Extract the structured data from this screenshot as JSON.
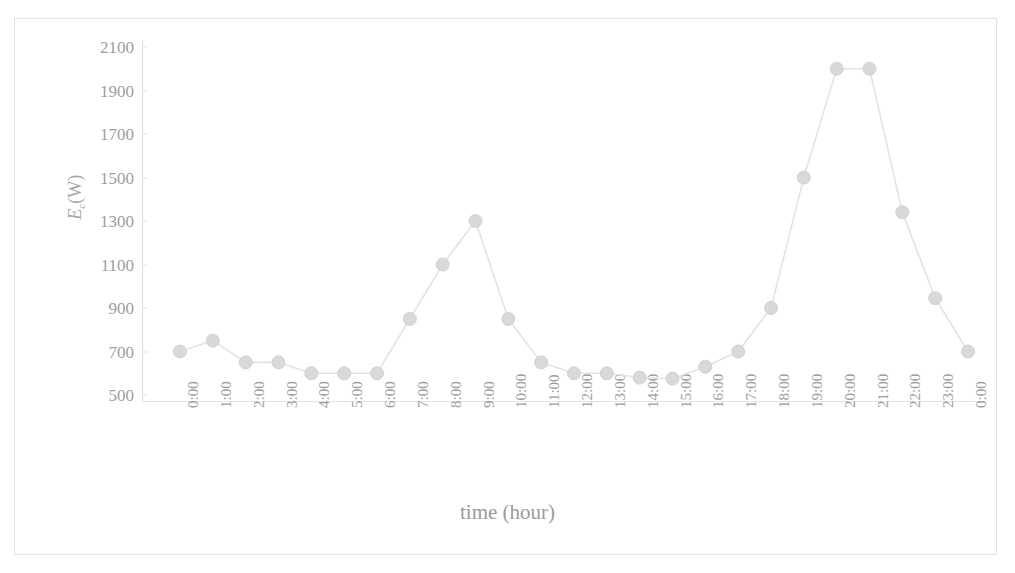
{
  "figure": {
    "top_caption": "",
    "frame_color": "#e2e2e2",
    "background": "#ffffff"
  },
  "axis": {
    "y_title_symbol": "E",
    "y_title_sub": "c",
    "y_title_unit": "(W)",
    "x_title": "time (hour)"
  },
  "chart_data": {
    "type": "line",
    "title": "",
    "xlabel": "time (hour)",
    "ylabel": "Ec (W)",
    "ylim": [
      500,
      2100
    ],
    "ytick_step": 200,
    "ytick_labels": [
      "2100",
      "1900",
      "1700",
      "1500",
      "1300",
      "1100",
      "900",
      "700",
      "500"
    ],
    "yticks": [
      2100,
      1900,
      1700,
      1500,
      1300,
      1100,
      900,
      700,
      500
    ],
    "grid": false,
    "legend": null,
    "marker": "circle",
    "marker_color": "#d9d9d9",
    "line_color": "#e3e3e3",
    "categories": [
      "0:00",
      "1:00",
      "2:00",
      "3:00",
      "4:00",
      "5:00",
      "6:00",
      "7:00",
      "8:00",
      "9:00",
      "10:00",
      "11:00",
      "12:00",
      "13:00",
      "14:00",
      "15:00",
      "16:00",
      "17:00",
      "18:00",
      "19:00",
      "20:00",
      "21:00",
      "22:00",
      "23:00",
      "0:00"
    ],
    "values": [
      700,
      750,
      650,
      650,
      600,
      600,
      600,
      850,
      1100,
      1300,
      850,
      650,
      600,
      600,
      580,
      575,
      630,
      700,
      900,
      1500,
      2000,
      2000,
      1340,
      945,
      700
    ],
    "series": [
      {
        "name": "Ec",
        "values": [
          700,
          750,
          650,
          650,
          600,
          600,
          600,
          850,
          1100,
          1300,
          850,
          650,
          600,
          600,
          580,
          575,
          630,
          700,
          900,
          1500,
          2000,
          2000,
          1340,
          945,
          700
        ]
      }
    ]
  }
}
